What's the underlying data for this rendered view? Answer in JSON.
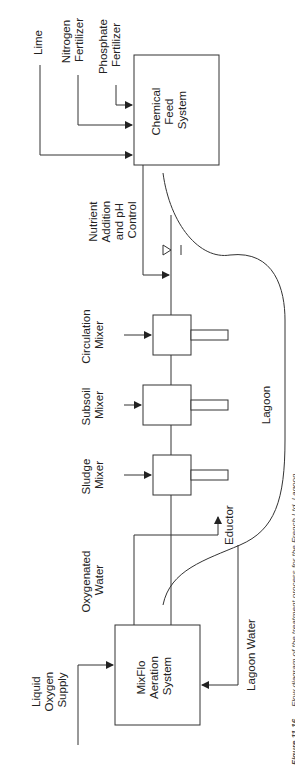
{
  "diagram": {
    "title": "Flow diagram of the treatment process",
    "orientation": "rotated 90 degrees counter-clockwise",
    "inputs": {
      "lime": "Lime",
      "nitrogen": [
        "Nitrogen",
        "Fertilizer"
      ],
      "phosphate": [
        "Phosphate",
        "Fertilizer"
      ]
    },
    "chemical_feed": [
      "Chemical",
      "Feed",
      "System"
    ],
    "nutrient_label": [
      "Nutrient",
      "Addition",
      "and pH",
      "Control"
    ],
    "mixers": [
      {
        "name": [
          "Circulation",
          "Mixer"
        ]
      },
      {
        "name": [
          "Subsoil",
          "Mixer"
        ]
      },
      {
        "name": [
          "Sludge",
          "Mixer"
        ]
      }
    ],
    "lagoon": "Lagoon",
    "eductor": "Eductor",
    "oxygenated_water": [
      "Oxygenated",
      "Water"
    ],
    "lagoon_water": "Lagoon Water",
    "liquid_oxygen": [
      "Liquid",
      "Oxygen",
      "Supply"
    ],
    "aeration": [
      "MixFlo",
      "Aeration",
      "System"
    ],
    "caption": {
      "number": "Figure 11.16",
      "text": "Flow diagram of the treatment process for the French Ltd. Lagoon."
    }
  }
}
